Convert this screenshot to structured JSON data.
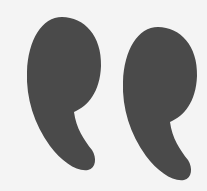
{
  "graphic": {
    "type": "quotation-mark",
    "glyph": "“",
    "fill_color": "#4a4a4a",
    "background_color": "#f4f4f4"
  }
}
